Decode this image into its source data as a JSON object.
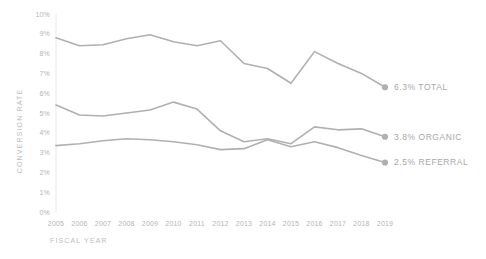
{
  "chart_data": {
    "type": "line",
    "title": "",
    "xlabel": "FISCAL YEAR",
    "ylabel": "CONVERSION RATE",
    "categories": [
      2005,
      2006,
      2007,
      2008,
      2009,
      2010,
      2011,
      2012,
      2013,
      2014,
      2015,
      2016,
      2017,
      2018,
      2019
    ],
    "xtick_labels": [
      "2005",
      "2006",
      "2007",
      "2008",
      "2009",
      "2010",
      "2011",
      "2012",
      "2013",
      "2014",
      "2015",
      "2016",
      "2017",
      "2018",
      "2019"
    ],
    "ytick_labels": [
      "0%",
      "1%",
      "2%",
      "3%",
      "4%",
      "5%",
      "6%",
      "7%",
      "8%",
      "9%",
      "10%"
    ],
    "ytick_values": [
      0,
      1,
      2,
      3,
      4,
      5,
      6,
      7,
      8,
      9,
      10
    ],
    "ylim": [
      0,
      10
    ],
    "grid": false,
    "legend_position": "end-of-line",
    "line_color": "#b0b0b0",
    "text_color": "#b4b4b4",
    "axis_color": "#e8e8e8",
    "series": [
      {
        "name": "TOTAL",
        "end_label": "6.3% TOTAL",
        "end_value": 6.3,
        "values": [
          8.8,
          8.4,
          8.45,
          8.75,
          8.95,
          8.6,
          8.4,
          8.65,
          7.5,
          7.25,
          6.5,
          8.1,
          7.5,
          7.0,
          6.3
        ]
      },
      {
        "name": "ORGANIC",
        "end_label": "3.8% ORGANIC",
        "end_value": 3.8,
        "values": [
          5.4,
          4.9,
          4.85,
          5.0,
          5.15,
          5.55,
          5.2,
          4.1,
          3.55,
          3.7,
          3.45,
          4.3,
          4.15,
          4.2,
          3.8
        ]
      },
      {
        "name": "REFERRAL",
        "end_label": "2.5% REFERRAL",
        "end_value": 2.5,
        "values": [
          3.35,
          3.45,
          3.6,
          3.7,
          3.65,
          3.55,
          3.4,
          3.15,
          3.2,
          3.65,
          3.3,
          3.55,
          3.25,
          2.85,
          2.5
        ]
      }
    ]
  }
}
